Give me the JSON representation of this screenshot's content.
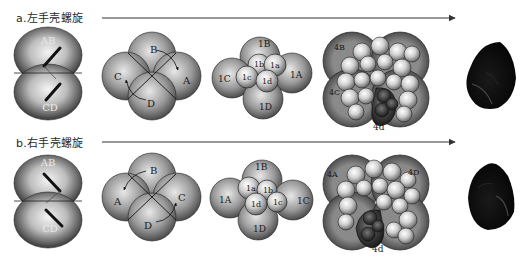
{
  "figure": {
    "rows": [
      {
        "id": "a",
        "title": "a.左手壳螺旋",
        "chirality": "sinistral",
        "stages": {
          "two_cell": {
            "labels": [
              "AB",
              "CD"
            ]
          },
          "four_cell": {
            "labels": [
              "B",
              "A",
              "C",
              "D"
            ]
          },
          "eight_cell": {
            "macromeres": [
              "1A",
              "1B",
              "1C",
              "1D"
            ],
            "micromeres": [
              "1a",
              "1b",
              "1c",
              "1d"
            ]
          },
          "blastula": {
            "labels": [
              "4B",
              "4C",
              "4d"
            ]
          },
          "shell": {
            "description": "left-coiled shell"
          }
        }
      },
      {
        "id": "b",
        "title": "b.右手壳螺旋",
        "chirality": "dextral",
        "stages": {
          "two_cell": {
            "labels": [
              "AB",
              "CD"
            ]
          },
          "four_cell": {
            "labels": [
              "B",
              "A",
              "C",
              "D"
            ]
          },
          "eight_cell": {
            "macromeres": [
              "1A",
              "1B",
              "1C",
              "1D"
            ],
            "micromeres": [
              "1a",
              "1b",
              "1c",
              "1d"
            ]
          },
          "blastula": {
            "labels": [
              "4A",
              "4D",
              "4d"
            ]
          },
          "shell": {
            "description": "right-coiled shell"
          }
        }
      }
    ],
    "colors": {
      "background": "#ffffff",
      "cell_dark": "#3a3a3a",
      "cell_light": "#f2f2f2",
      "outline": "#1c1c1c",
      "shell": "#0d0d0d",
      "arrow": "#333333",
      "d_quadrant": "#2c2c2c"
    }
  }
}
